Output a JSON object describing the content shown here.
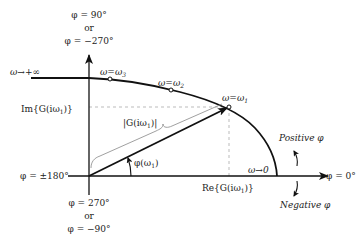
{
  "figure": {
    "type": "nyquist-polar-plot",
    "colors": {
      "axis": "#111111",
      "curve": "#111111",
      "guide": "#bbbbbb",
      "brace": "#888888",
      "text": "#222222"
    }
  },
  "labels": {
    "top_phase_line1": "φ = 90°",
    "top_phase_or": "or",
    "top_phase_line2": "φ = −270°",
    "bottom_phase_line1": "φ = 270°",
    "bottom_phase_or": "or",
    "bottom_phase_line2": "φ = −90°",
    "left_phase": "φ = ±180°",
    "right_phase": "φ = 0°",
    "omega_inf": "ω→+∞",
    "omega_zero": "ω→0",
    "omega1": "ω=ω",
    "omega1_sub": "1",
    "omega2": "ω=ω",
    "omega2_sub": "2",
    "omega3": "ω=ω",
    "omega3_sub": "3",
    "im_label": "Im{G(iω",
    "im_sub": "1",
    "im_close": ")}",
    "re_label": "Re{G(iω",
    "re_sub": "1",
    "re_close": ")}",
    "magnitude_label": "|G(iω",
    "magnitude_sub": "1",
    "magnitude_close": ")|",
    "angle_label": "φ(ω",
    "angle_sub": "1",
    "angle_close": ")",
    "positive_phi": "Positive φ",
    "negative_phi": "Negative φ"
  },
  "points": [
    {
      "name": "omega3",
      "x": 110,
      "y": 79
    },
    {
      "name": "omega2",
      "x": 171,
      "y": 90
    },
    {
      "name": "omega1",
      "x": 229,
      "y": 107
    }
  ]
}
